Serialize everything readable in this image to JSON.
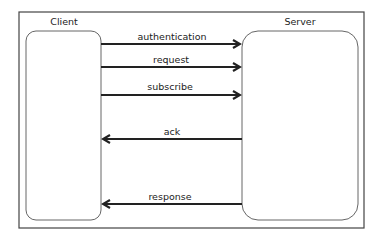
{
  "diagram": {
    "nodes": {
      "client": {
        "label": "Client"
      },
      "server": {
        "label": "Server"
      }
    },
    "messages": [
      {
        "label": "authentication",
        "direction": "client-to-server"
      },
      {
        "label": "request",
        "direction": "client-to-server"
      },
      {
        "label": "subscribe",
        "direction": "client-to-server"
      },
      {
        "label": "ack",
        "direction": "server-to-client"
      },
      {
        "label": "response",
        "direction": "server-to-client"
      }
    ],
    "colors": {
      "stroke": "#222222",
      "box_stroke": "#555555",
      "background": "#ffffff"
    }
  }
}
